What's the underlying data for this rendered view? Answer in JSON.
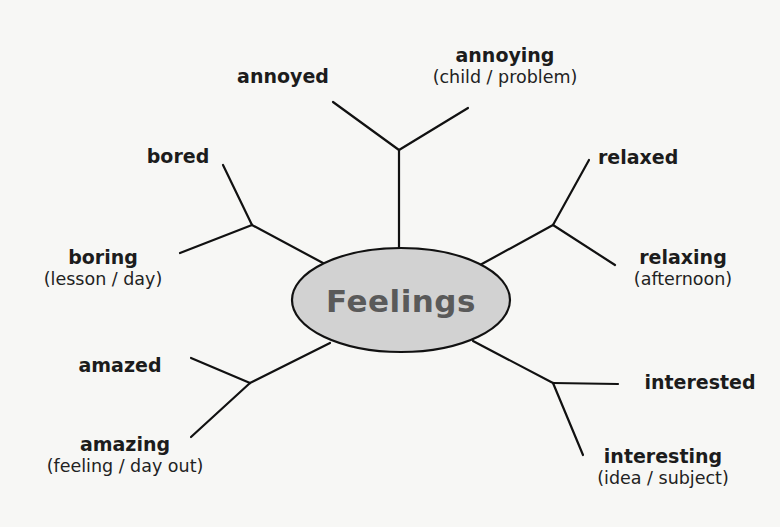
{
  "diagram": {
    "title": "Feelings",
    "colors": {
      "background": "#f7f7f5",
      "center_fill": "#d2d2d2",
      "center_text": "#5a5a5a",
      "lines": "#111111"
    },
    "branches": [
      {
        "id": "top",
        "items": [
          {
            "word": "annoyed",
            "note": ""
          },
          {
            "word": "annoying",
            "note": "(child / problem)"
          }
        ]
      },
      {
        "id": "upper-left",
        "items": [
          {
            "word": "bored",
            "note": ""
          },
          {
            "word": "boring",
            "note": "(lesson / day)"
          }
        ]
      },
      {
        "id": "upper-right",
        "items": [
          {
            "word": "relaxed",
            "note": ""
          },
          {
            "word": "relaxing",
            "note": "(afternoon)"
          }
        ]
      },
      {
        "id": "lower-left",
        "items": [
          {
            "word": "amazed",
            "note": ""
          },
          {
            "word": "amazing",
            "note": "(feeling / day out)"
          }
        ]
      },
      {
        "id": "lower-right",
        "items": [
          {
            "word": "interested",
            "note": ""
          },
          {
            "word": "interesting",
            "note": "(idea / subject)"
          }
        ]
      }
    ]
  }
}
